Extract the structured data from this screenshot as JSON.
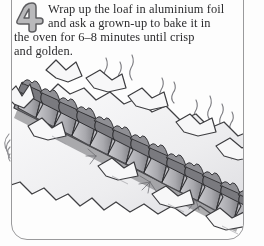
{
  "page": {
    "kind": "recipe-step-panel",
    "background_color": "#fdfdfd",
    "border_color": "#9a9a9c",
    "ink_color": "#2b2b2d"
  },
  "step": {
    "number": "4",
    "number_style": "hand-drawn-outline-gray",
    "badge_fill": "#b9b9bb",
    "badge_stroke": "#5d5d60"
  },
  "instructions": {
    "full_text": "Wrap up the loaf in aluminium foil and ask a grown-up to bake it in the oven for 6–8 minutes until crisp and golden.",
    "lines": [
      "Wrap up the loaf in aluminium foil",
      "and ask a grown-up to bake it in",
      "the oven for 6–8 minutes until crisp",
      "and golden."
    ]
  },
  "illustration": {
    "subject": "baked sliced loaf of bread wrapped in aluminium foil",
    "description": "Pen-and-ink grayscale drawing of a long loaf cut into thick slices, resting on crumpled aluminium foil, running diagonally from upper-left to lower-right, with wavy steam wisps rising above it.",
    "elements": [
      "sliced-loaf",
      "aluminium-foil-wrapper",
      "steam-wisps",
      "crust-texture-stippling"
    ],
    "bread_slice_count": 13,
    "steam_wisp_count": 11,
    "palette": {
      "crust_dark": "#6f6f73",
      "crust_mid": "#9d9da1",
      "crumb_light": "#d6d6d9",
      "foil_light": "#f4f4f5",
      "outline": "#3c3c3e"
    }
  }
}
